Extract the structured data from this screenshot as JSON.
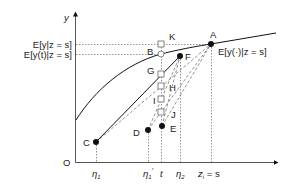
{
  "diagram": {
    "axes": {
      "y_label": "y",
      "origin_label": "O",
      "x_ticks": [
        {
          "id": "eta1",
          "label": "η",
          "sub": "1",
          "sup": "",
          "x": 96
        },
        {
          "id": "eta1p",
          "label": "η",
          "sub": "1",
          "sup": "′",
          "x": 148
        },
        {
          "id": "t",
          "label": "t",
          "sub": "",
          "sup": "",
          "x": 162
        },
        {
          "id": "eta2",
          "label": "η",
          "sub": "2",
          "sup": "",
          "x": 180
        },
        {
          "id": "zs",
          "label": "z",
          "sub": "i",
          "sup": "",
          "suffix": " = s",
          "x": 211
        }
      ]
    },
    "y_levels": [
      {
        "id": "ey",
        "label": "E[y|z = s]",
        "y": 44
      },
      {
        "id": "eyt",
        "label": "E[y(t)|z = s]",
        "y": 54
      }
    ],
    "curve_label": "E[y(·)|z = s]",
    "points": {
      "A": {
        "label": "A",
        "x": 211,
        "y": 44,
        "kind": "filled"
      },
      "B": {
        "label": "B",
        "x": 161,
        "y": 54,
        "kind": "open-circle"
      },
      "C": {
        "label": "C",
        "x": 96,
        "y": 142,
        "kind": "filled"
      },
      "D": {
        "label": "D",
        "x": 148,
        "y": 130,
        "kind": "filled"
      },
      "E": {
        "label": "E",
        "x": 162,
        "y": 126,
        "kind": "filled"
      },
      "F": {
        "label": "F",
        "x": 180,
        "y": 56,
        "kind": "filled"
      },
      "G": {
        "label": "G",
        "x": 161,
        "y": 74,
        "kind": "open-square"
      },
      "H": {
        "label": "H",
        "x": 161,
        "y": 86,
        "kind": "open-square"
      },
      "I": {
        "label": "I",
        "x": 161,
        "y": 99,
        "kind": "open-square"
      },
      "J": {
        "label": "J",
        "x": 161,
        "y": 112,
        "kind": "open-square"
      },
      "K": {
        "label": "K",
        "x": 161,
        "y": 44,
        "kind": "open-square"
      }
    }
  }
}
